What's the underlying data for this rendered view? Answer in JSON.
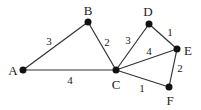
{
  "diagram": {
    "type": "weighted-graph",
    "nodes": [
      {
        "id": "A",
        "label": "A",
        "x": 23,
        "y": 70,
        "lx": 13,
        "ly": 75
      },
      {
        "id": "B",
        "label": "B",
        "x": 88,
        "y": 22,
        "lx": 88,
        "ly": 15
      },
      {
        "id": "C",
        "label": "C",
        "x": 116,
        "y": 70,
        "lx": 116,
        "ly": 89
      },
      {
        "id": "D",
        "label": "D",
        "x": 149,
        "y": 24,
        "lx": 148,
        "ly": 16
      },
      {
        "id": "E",
        "label": "E",
        "x": 177,
        "y": 49,
        "lx": 188,
        "ly": 55
      },
      {
        "id": "F",
        "label": "F",
        "x": 169,
        "y": 87,
        "lx": 170,
        "ly": 105
      }
    ],
    "edges": [
      {
        "from": "A",
        "to": "B",
        "weight": "3",
        "wx": 49,
        "wy": 45
      },
      {
        "from": "B",
        "to": "C",
        "weight": "2",
        "wx": 107,
        "wy": 46
      },
      {
        "from": "A",
        "to": "C",
        "weight": "4",
        "wx": 70,
        "wy": 84
      },
      {
        "from": "C",
        "to": "D",
        "weight": "3",
        "wx": 128,
        "wy": 44
      },
      {
        "from": "C",
        "to": "E",
        "weight": "4",
        "wx": 149,
        "wy": 55
      },
      {
        "from": "D",
        "to": "E",
        "weight": "1",
        "wx": 170,
        "wy": 36
      },
      {
        "from": "E",
        "to": "F",
        "weight": "2",
        "wx": 180,
        "wy": 72
      },
      {
        "from": "C",
        "to": "F",
        "weight": "1",
        "wx": 142,
        "wy": 92
      }
    ]
  }
}
